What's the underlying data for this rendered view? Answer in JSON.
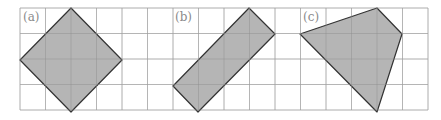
{
  "figure": {
    "grid": {
      "x0": 20,
      "y0": 8,
      "cell": 25.5,
      "cols": 16,
      "rows": 4,
      "line_color": "#d6d6d6"
    },
    "shape_fill": "#b5b5b5",
    "shape_stroke": "#333333",
    "panels": [
      {
        "label": "(a)",
        "label_x": 23,
        "label_y": 21,
        "points": "71,8 122,60 71,112 20,60"
      },
      {
        "label": "(b)",
        "label_x": 175,
        "label_y": 21,
        "points": "249,8 275,34 198,112 173,86"
      },
      {
        "label": "(c)",
        "label_x": 303,
        "label_y": 21,
        "points": "300,34 377,8 402,34 377,112"
      }
    ]
  }
}
